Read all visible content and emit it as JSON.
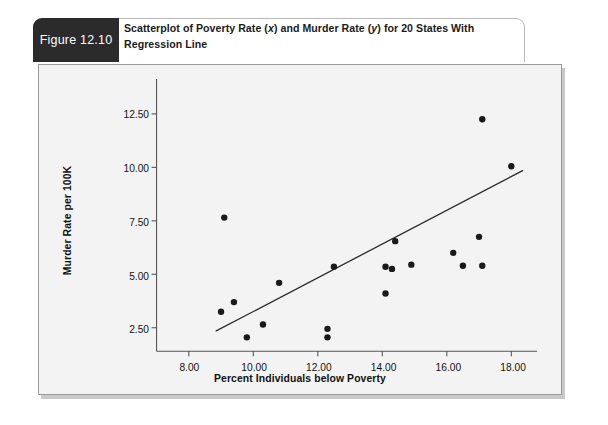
{
  "figure": {
    "badge_label": "Figure 12.10",
    "title_part1": "Scatterplot of Poverty Rate (",
    "title_x": "x",
    "title_part2": ") and Murder Rate (",
    "title_y": "y",
    "title_part3": ") for 20 States With Regression Line",
    "badge_color": "#2b2b2b",
    "panel_color": "#f3f3f3",
    "border_color": "#9a9a9a"
  },
  "chart_data": {
    "type": "scatter",
    "title": "Scatterplot of Poverty Rate (x) and Murder Rate (y) for 20 States With Regression Line",
    "xlabel": "Percent Individuals below Poverty",
    "ylabel": "Murder Rate per 100K",
    "xlim": [
      7.0,
      18.8
    ],
    "ylim": [
      1.4,
      13.3
    ],
    "xticks": [
      8.0,
      10.0,
      12.0,
      14.0,
      16.0,
      18.0
    ],
    "xticklabels": [
      "8.00",
      "10.00",
      "12.00",
      "14.00",
      "16.00",
      "18.00"
    ],
    "yticks": [
      2.5,
      5.0,
      7.5,
      10.0,
      12.5
    ],
    "yticklabels": [
      "2.50",
      "5.00",
      "7.50",
      "10.00",
      "12.50"
    ],
    "grid": false,
    "legend": false,
    "n_points": 20,
    "marker_color": "#1a1a1a",
    "marker_size": 3.2,
    "points": [
      {
        "x": 9.1,
        "y": 7.65
      },
      {
        "x": 9.0,
        "y": 3.25
      },
      {
        "x": 9.4,
        "y": 3.7
      },
      {
        "x": 9.8,
        "y": 2.05
      },
      {
        "x": 10.3,
        "y": 2.65
      },
      {
        "x": 10.8,
        "y": 4.6
      },
      {
        "x": 12.3,
        "y": 2.45
      },
      {
        "x": 12.3,
        "y": 2.05
      },
      {
        "x": 12.5,
        "y": 5.35
      },
      {
        "x": 14.1,
        "y": 5.35
      },
      {
        "x": 14.1,
        "y": 4.1
      },
      {
        "x": 14.3,
        "y": 5.25
      },
      {
        "x": 14.4,
        "y": 6.55
      },
      {
        "x": 14.9,
        "y": 5.45
      },
      {
        "x": 16.2,
        "y": 6.0
      },
      {
        "x": 16.5,
        "y": 5.4
      },
      {
        "x": 17.0,
        "y": 6.75
      },
      {
        "x": 17.1,
        "y": 12.25
      },
      {
        "x": 17.1,
        "y": 5.4
      },
      {
        "x": 18.0,
        "y": 10.05
      }
    ],
    "regression_line": {
      "x_start": 8.85,
      "y_start": 2.35,
      "x_end": 18.35,
      "y_end": 9.85,
      "color": "#2a2a2a",
      "width": 1.3
    },
    "axis_color": "#555555"
  }
}
